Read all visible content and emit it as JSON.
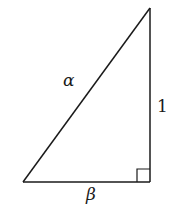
{
  "diagram": {
    "type": "right-triangle",
    "vertices": {
      "top": [
        150,
        8
      ],
      "bottom_left": [
        23,
        182
      ],
      "right_angle": [
        150,
        182
      ]
    },
    "right_angle_marker_size": 13,
    "stroke_color": "#1a1a1a",
    "background": "#ffffff",
    "labels": {
      "hypotenuse": "α",
      "vertical_leg": "1",
      "horizontal_leg": "β"
    }
  }
}
